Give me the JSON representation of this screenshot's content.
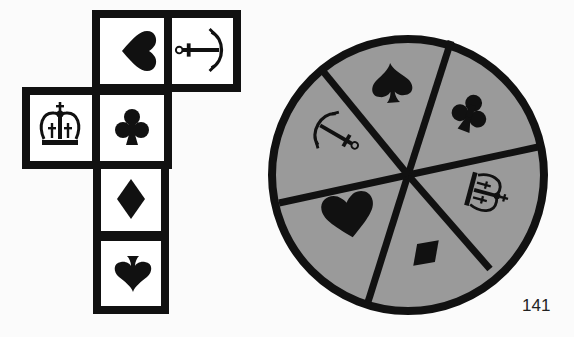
{
  "puzzle": {
    "cube_net": {
      "faces": [
        {
          "position": "top-middle",
          "symbol": "heart",
          "rotation": "90deg-left"
        },
        {
          "position": "top-right",
          "symbol": "anchor",
          "rotation": "90deg-left"
        },
        {
          "position": "middle-left",
          "symbol": "crown",
          "rotation": "upright"
        },
        {
          "position": "center",
          "symbol": "club",
          "rotation": "upright"
        },
        {
          "position": "below-center",
          "symbol": "diamond",
          "rotation": "upright"
        },
        {
          "position": "bottom",
          "symbol": "spade",
          "rotation": "upside-down"
        }
      ]
    },
    "wheel": {
      "fill_color": "#9a9a9a",
      "segments": [
        "spade",
        "club",
        "crown",
        "diamond",
        "heart",
        "anchor"
      ]
    }
  },
  "page_number": "141"
}
